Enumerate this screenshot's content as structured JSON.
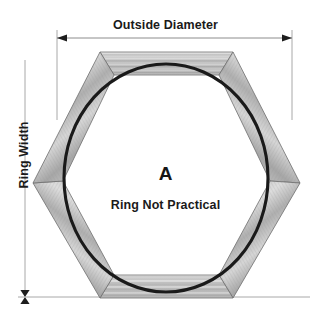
{
  "diagram": {
    "title_top": "Outside Diameter",
    "label_left": "Ring Width",
    "center_letter": "A",
    "center_note": "Ring Not Practical",
    "colors": {
      "line": "#1a1a1a",
      "dimension_line": "#8c8c8c",
      "wood_light": "#e6e6e6",
      "wood_mid": "#bdbdbd",
      "wood_dark": "#8f8f8f",
      "background": "#ffffff"
    },
    "geometry": {
      "shape": "hexagon",
      "orientation": "flat-top",
      "segment_count": 6,
      "circle_center_x": 166,
      "circle_center_y": 178,
      "circle_radius_x": 102,
      "circle_radius_y": 114,
      "outer_left_x": 33,
      "outer_right_x": 300,
      "outer_top_y": 52,
      "outer_bottom_y": 298,
      "vertex_y": 183
    },
    "dimensions": {
      "outside_diameter": {
        "axis": "horizontal",
        "y": 38,
        "x_start": 57,
        "x_end": 292,
        "arrow_start": "left",
        "arrow_end": "right"
      },
      "ring_width": {
        "axis": "vertical",
        "x": 25,
        "y_start": 52,
        "y_end": 297,
        "arrow_end": "double-head"
      }
    }
  }
}
